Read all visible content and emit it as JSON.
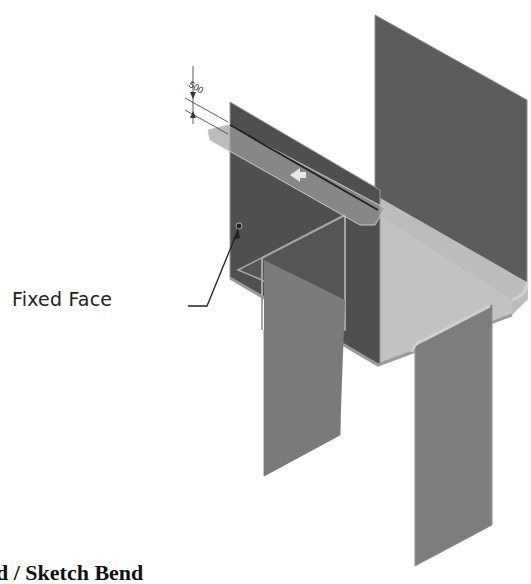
{
  "figure": {
    "type": "sheet-metal-isometric",
    "dimension": {
      "value": ".500"
    },
    "callout": {
      "label": "Fixed Face"
    },
    "caption": {
      "text": "d / Sketch Bend"
    },
    "colors": {
      "dark_face": "#5a5a5a",
      "mid_face": "#7a7a7a",
      "light_face": "#bdbdbd",
      "bend_line": "#a8a8a8",
      "background": "#ffffff"
    }
  }
}
